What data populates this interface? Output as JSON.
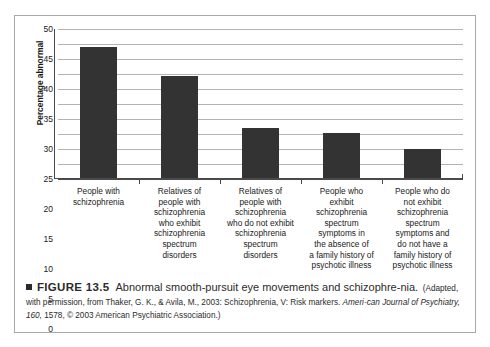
{
  "figure": {
    "caption_marker": "■",
    "figure_number": "FIGURE 13.5",
    "title": "Abnormal smooth-pursuit eye movements and schizophre-",
    "title_cont": "nia.",
    "source_part1": "(Adapted, with permission, from Thaker, G. K., & Avila, M., 2003: Schizophrenia, V: Risk markers. ",
    "source_italic1": "Ameri-",
    "source_italic2": "can Journal of Psychiatry, 160,",
    "source_part2": " 1578, © 2003 American Psychiatric Association.)"
  },
  "chart_data": {
    "type": "bar",
    "title": "",
    "xlabel": "",
    "ylabel": "Percentage abnormal",
    "ylim": [
      0,
      50
    ],
    "ytick_step": 5,
    "ytick_labels": [
      "0",
      "5",
      "10",
      "15",
      "20",
      "25",
      "30",
      "35",
      "40",
      "45",
      "50"
    ],
    "grid": true,
    "legend": "none",
    "bar_color": "#333333",
    "gridline_color": "#b4b4b4",
    "axis_color": "#4a4a4a",
    "categories": [
      "People with schizophrenia",
      "Relatives of people with schizophrenia who exhibit schizophrenia spectrum disorders",
      "Relatives of people with schizophrenia who do not exhibit schizophrenia spectrum disorders",
      "People who exhibit schizophrenia spectrum symptoms in the absence of a family history of psychotic illness",
      "People who do not exhibit schizophrenia spectrum symptoms and do not have a family history of psychotic illness"
    ],
    "category_lines": [
      [
        "People with",
        "schizophrenia"
      ],
      [
        "Relatives of",
        "people with",
        "schizophrenia",
        "who exhibit",
        "schizophrenia",
        "spectrum",
        "disorders"
      ],
      [
        "Relatives of",
        "people with",
        "schizophrenia",
        "who do not exhibit",
        "schizophrenia",
        "spectrum",
        "disorders"
      ],
      [
        "People who",
        "exhibit",
        "schizophrenia",
        "spectrum",
        "symptoms in",
        "the absence of",
        "a family history of",
        "psychotic illness"
      ],
      [
        "People who do",
        "not exhibit",
        "schizophrenia",
        "spectrum",
        "symptoms and",
        "do not have a",
        "family history of",
        "psychotic illness"
      ]
    ],
    "values": [
      44,
      34.5,
      17,
      15.5,
      10
    ]
  }
}
